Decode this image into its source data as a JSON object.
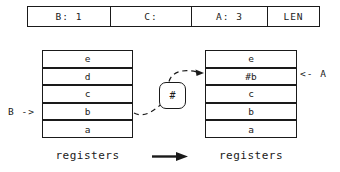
{
  "header_table": {
    "cells": [
      "B: 1",
      "C:",
      "A: 3",
      "LEN"
    ]
  },
  "before_stack": {
    "pointer_label": "B ->",
    "rows": [
      "e",
      "d",
      "c",
      "b",
      "a"
    ],
    "caption": "registers"
  },
  "after_stack": {
    "pointer_label": "<- A",
    "rows": [
      "e",
      "#b",
      "c",
      "b",
      "a"
    ],
    "caption": "registers"
  },
  "operator": {
    "symbol": "#"
  },
  "colors": {
    "ink": "#1a1a1a",
    "paper": "#ffffff"
  }
}
